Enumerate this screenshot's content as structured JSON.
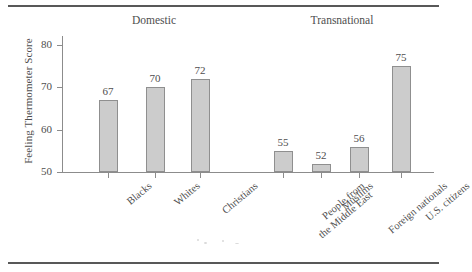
{
  "figure": {
    "ylabel": "Feeling Thermometer Score",
    "groups": [
      {
        "label": "Domestic"
      },
      {
        "label": "Transnational"
      }
    ]
  },
  "chart_data": {
    "type": "bar",
    "title": "",
    "xlabel": "",
    "ylabel": "Feeling Thermometer Score",
    "ylim": [
      50,
      82
    ],
    "yticks": [
      50,
      60,
      70,
      80
    ],
    "grid": false,
    "legend": null,
    "bar_color": "#cccccc",
    "bar_edge_color": "#8f8f8f",
    "group_labels": [
      "Domestic",
      "Transnational"
    ],
    "groups": [
      {
        "name": "Domestic",
        "categories": [
          "Blacks",
          "Whites",
          "Christians"
        ],
        "values": [
          67,
          70,
          72
        ]
      },
      {
        "name": "Transnational",
        "categories": [
          "People from the Middle East",
          "Muslims",
          "Foreign nationals",
          "U.S. citizens"
        ],
        "values": [
          55,
          52,
          56,
          75
        ]
      }
    ],
    "categories": [
      "Blacks",
      "Whites",
      "Christians",
      "People from the Middle East",
      "Muslims",
      "Foreign nationals",
      "U.S. citizens"
    ],
    "category_lines": [
      [
        "Blacks"
      ],
      [
        "Whites"
      ],
      [
        "Christians"
      ],
      [
        "People from",
        "the Middle East"
      ],
      [
        "Muslims"
      ],
      [
        "Foreign nationals"
      ],
      [
        "U.S. citizens"
      ]
    ],
    "values": [
      67,
      70,
      72,
      55,
      52,
      56,
      75
    ],
    "value_labels": [
      "67",
      "70",
      "72",
      "55",
      "52",
      "56",
      "75"
    ],
    "tick_labels": [
      "50",
      "60",
      "70",
      "80"
    ]
  }
}
